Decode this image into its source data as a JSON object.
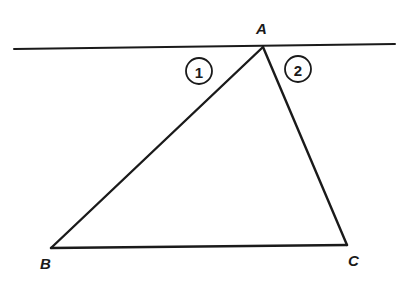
{
  "diagram": {
    "colors": {
      "ink": "#1a1a1a",
      "background": "#ffffff"
    },
    "parallel_line": {
      "x1": 14,
      "y1": 49,
      "x2": 395,
      "y2": 44
    },
    "vertices": {
      "A": {
        "label": "A",
        "x": 263,
        "y": 47,
        "label_x": 256,
        "label_y": 34
      },
      "B": {
        "label": "B",
        "x": 51,
        "y": 248,
        "label_x": 40,
        "label_y": 269
      },
      "C": {
        "label": "C",
        "x": 347,
        "y": 245,
        "label_x": 348,
        "label_y": 266
      }
    },
    "angle_markers": [
      {
        "label": "1",
        "cx": 199,
        "cy": 71,
        "r": 13
      },
      {
        "label": "2",
        "cx": 298,
        "cy": 69,
        "r": 13
      }
    ]
  }
}
